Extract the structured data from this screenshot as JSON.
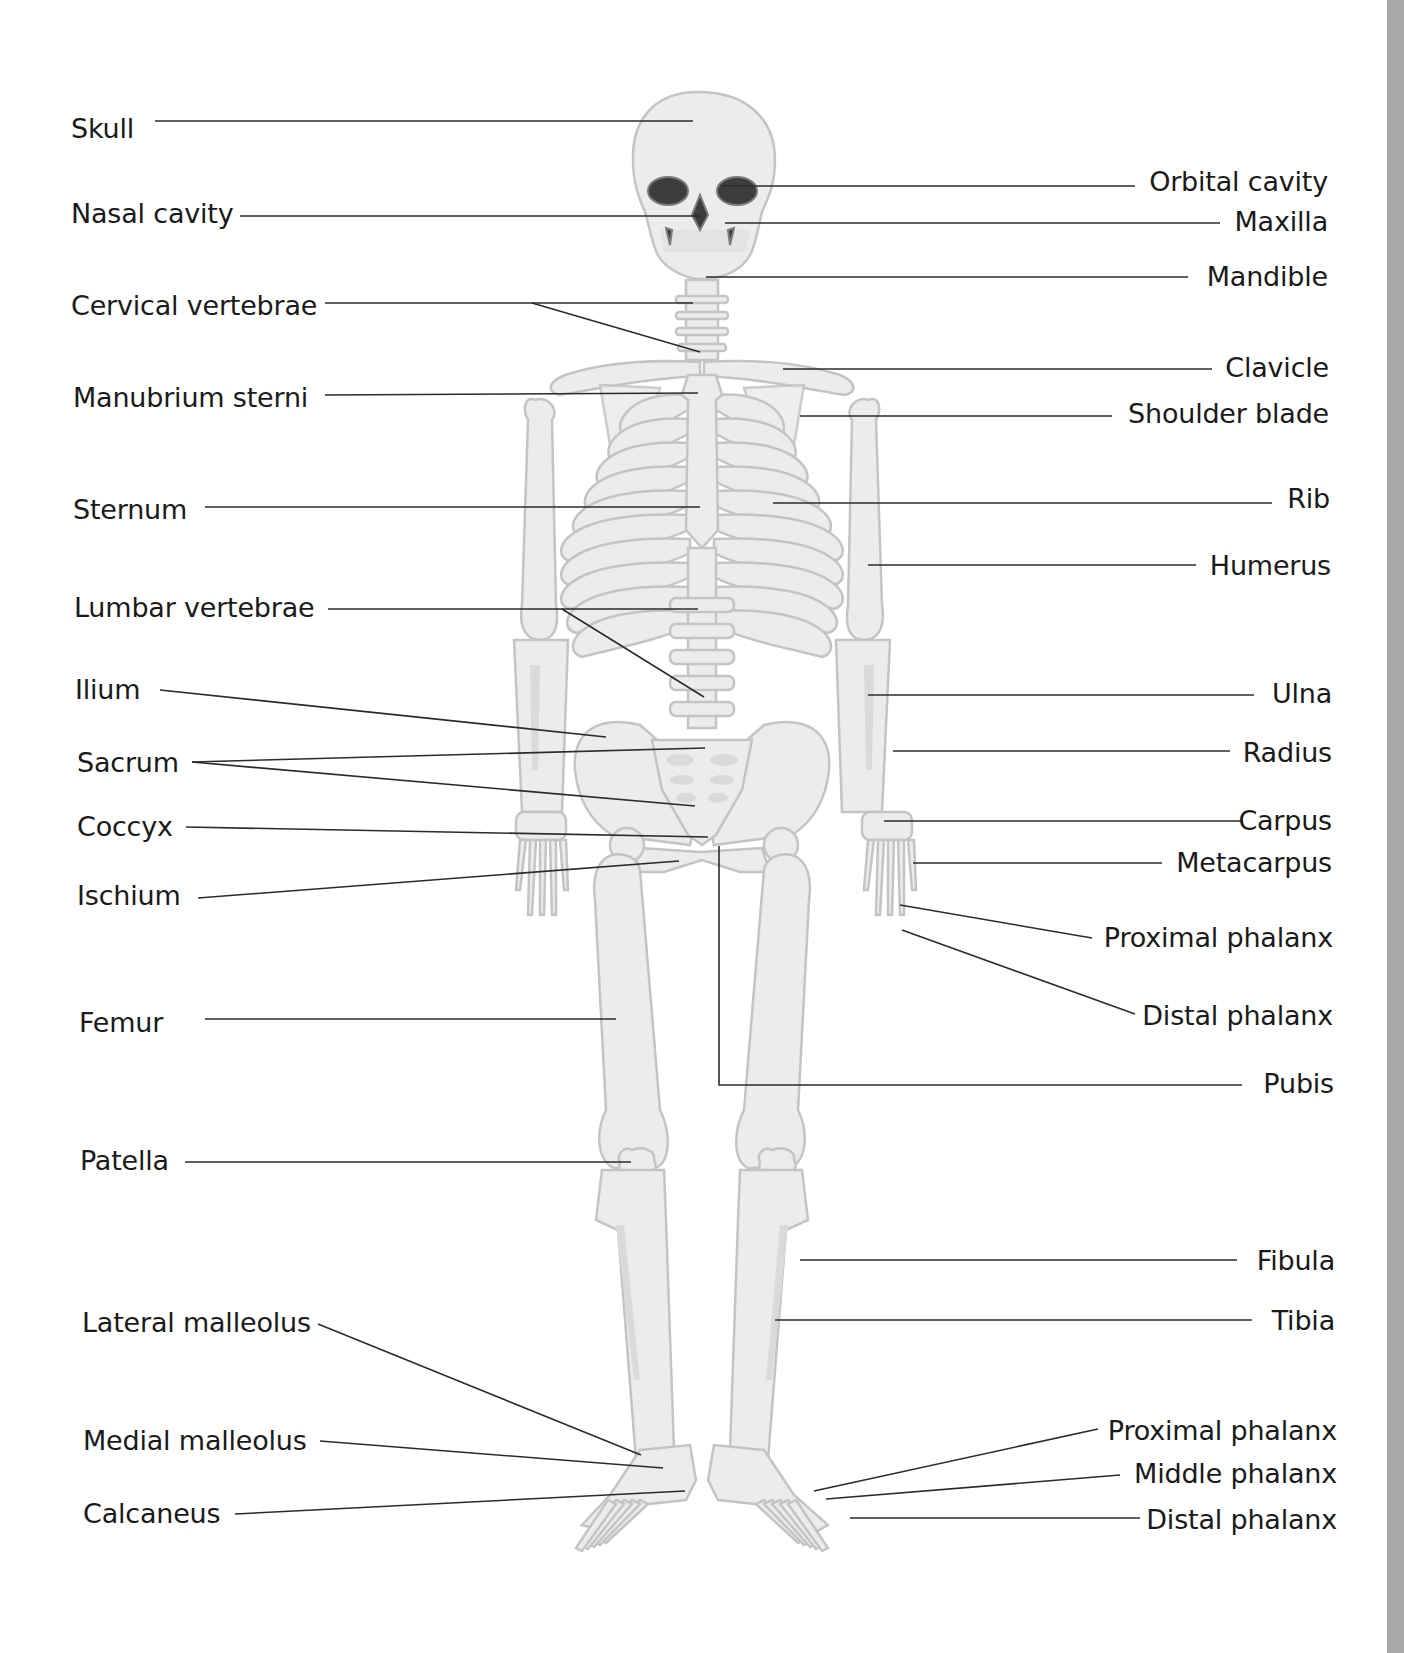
{
  "diagram": {
    "colors": {
      "bone_fill": "#ececec",
      "bone_outline": "#c4c4c4",
      "cavity": "#3d3d3d",
      "leader_line": "#2b2b2b",
      "label_text": "#1a1a1a",
      "side_bar": "#a9a9a9"
    },
    "labels_left": [
      {
        "id": "skull",
        "text": "Skull"
      },
      {
        "id": "nasal-cavity",
        "text": "Nasal cavity"
      },
      {
        "id": "cervical-vertebrae",
        "text": "Cervical vertebrae"
      },
      {
        "id": "manubrium-sterni",
        "text": "Manubrium sterni"
      },
      {
        "id": "sternum",
        "text": "Sternum"
      },
      {
        "id": "lumbar-vertebrae",
        "text": "Lumbar vertebrae"
      },
      {
        "id": "ilium",
        "text": "Ilium"
      },
      {
        "id": "sacrum",
        "text": "Sacrum"
      },
      {
        "id": "coccyx",
        "text": "Coccyx"
      },
      {
        "id": "ischium",
        "text": "Ischium"
      },
      {
        "id": "femur",
        "text": "Femur"
      },
      {
        "id": "patella",
        "text": "Patella"
      },
      {
        "id": "lateral-malleolus",
        "text": "Lateral malleolus"
      },
      {
        "id": "medial-malleolus",
        "text": "Medial malleolus"
      },
      {
        "id": "calcaneus",
        "text": "Calcaneus"
      }
    ],
    "labels_right": [
      {
        "id": "orbital-cavity",
        "text": "Orbital cavity"
      },
      {
        "id": "maxilla",
        "text": "Maxilla"
      },
      {
        "id": "mandible",
        "text": "Mandible"
      },
      {
        "id": "clavicle",
        "text": "Clavicle"
      },
      {
        "id": "shoulder-blade",
        "text": "Shoulder blade"
      },
      {
        "id": "rib",
        "text": "Rib"
      },
      {
        "id": "humerus",
        "text": "Humerus"
      },
      {
        "id": "ulna",
        "text": "Ulna"
      },
      {
        "id": "radius",
        "text": "Radius"
      },
      {
        "id": "carpus",
        "text": "Carpus"
      },
      {
        "id": "metacarpus",
        "text": "Metacarpus"
      },
      {
        "id": "proximal-phalanx-hand",
        "text": "Proximal phalanx"
      },
      {
        "id": "distal-phalanx-hand",
        "text": "Distal phalanx"
      },
      {
        "id": "pubis",
        "text": "Pubis"
      },
      {
        "id": "fibula",
        "text": "Fibula"
      },
      {
        "id": "tibia",
        "text": "Tibia"
      },
      {
        "id": "proximal-phalanx-foot",
        "text": "Proximal phalanx"
      },
      {
        "id": "middle-phalanx-foot",
        "text": "Middle phalanx"
      },
      {
        "id": "distal-phalanx-foot",
        "text": "Distal phalanx"
      }
    ]
  }
}
